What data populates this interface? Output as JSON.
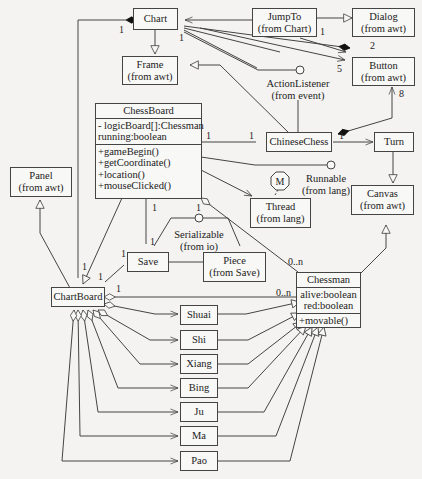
{
  "boxes": {
    "chart": {
      "name": "Chart"
    },
    "jumpto": {
      "name": "JumpTo",
      "pkg": "(from Chart)"
    },
    "dialog": {
      "name": "Dialog",
      "pkg": "(from awt)"
    },
    "frame": {
      "name": "Frame",
      "pkg": "(from awt)"
    },
    "button": {
      "name": "Button",
      "pkg": "(from awt)"
    },
    "chinesechess": {
      "name": "ChineseChess"
    },
    "turn": {
      "name": "Turn"
    },
    "canvas": {
      "name": "Canvas",
      "pkg": "(from awt)"
    },
    "thread": {
      "name": "Thread",
      "pkg": "(from lang)"
    },
    "panel": {
      "name": "Panel",
      "pkg": "(from awt)"
    },
    "save": {
      "name": "Save"
    },
    "piece": {
      "name": "Piece",
      "pkg": "(from Save)"
    },
    "chartboard": {
      "name": "ChartBoard"
    },
    "shuai": {
      "name": "Shuai"
    },
    "shi": {
      "name": "Shi"
    },
    "xiang": {
      "name": "Xiang"
    },
    "bing": {
      "name": "Bing"
    },
    "ju": {
      "name": "Ju"
    },
    "ma": {
      "name": "Ma"
    },
    "pao": {
      "name": "Pao"
    }
  },
  "classes": {
    "chessboard": {
      "name": "ChessBoard",
      "attributes": [
        "- logicBoard[]:Chessman",
        "running:boolean"
      ],
      "methods": [
        "+gameBegin()",
        "+getCoordinate()",
        "+location()",
        "+mouseClicked()"
      ]
    },
    "chessman": {
      "name": "Chessman",
      "attributes": [
        "alive:boolean",
        "red:boolean"
      ],
      "methods": [
        "+movable()"
      ]
    }
  },
  "interfaces": {
    "actionlistener": {
      "name": "ActionListener",
      "pkg": "(from event)"
    },
    "runnable": {
      "name": "Runnable",
      "pkg": "(from lang)",
      "badge": "M"
    },
    "serializable": {
      "name": "Serializable",
      "pkg": "(from io)"
    }
  },
  "multiplicities": {
    "chart_left": "1",
    "chart_right": "1",
    "jumpto_button_src": "1",
    "jumpto_button_dst": "2",
    "chart_button": "5",
    "cc_button": "8",
    "cb_cc_left": "1",
    "cb_cc_right": "1",
    "cc_turn": "1",
    "cb_save_top": "1",
    "cb_save_bottom": "1",
    "cb_chessman": "1",
    "save_cbd_top": "1",
    "save_cbd_bottom": "1",
    "chartboard_up": "1",
    "chartboard_chessman_src": "1",
    "chartboard_chessman_dst": "0..n",
    "chessboard_chessman_dst": "0..n"
  },
  "colors": {
    "line": "#444444",
    "background": "#f4f3f1",
    "box": "#f8f8f6"
  }
}
